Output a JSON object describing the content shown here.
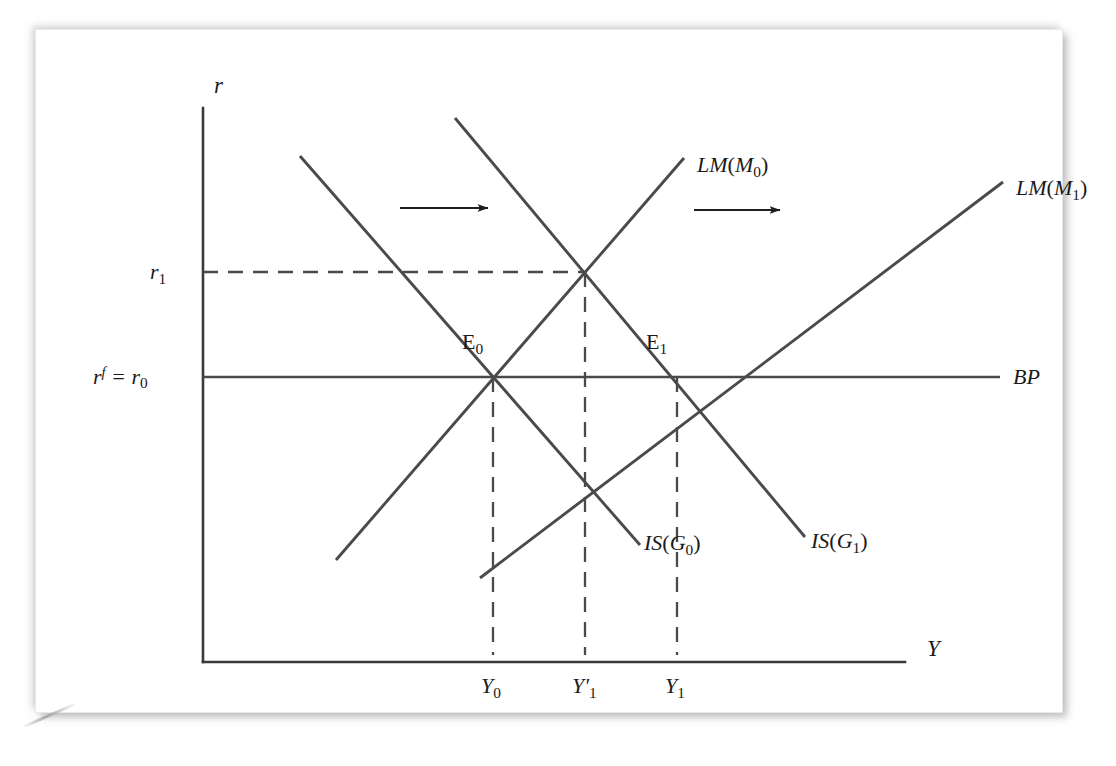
{
  "figure": {
    "kind": "economics-diagram",
    "model": "IS-LM-BP",
    "background_color": "#ffffff",
    "ink_color": "#3a3a3a"
  },
  "axes": {
    "y_axis_label": "r",
    "x_axis_label": "Y",
    "origin": {
      "x": 203,
      "y": 662
    },
    "y_top": {
      "x": 203,
      "y": 108
    },
    "x_right": {
      "x": 905,
      "y": 662
    }
  },
  "y_ticks": [
    {
      "id": "r1",
      "text": "r",
      "sub": "1",
      "value_y": 272,
      "label_x": 150,
      "label_y": 262
    },
    {
      "id": "rf_r0",
      "text": "r",
      "sup": "f",
      "eq": " = r",
      "sub": "0",
      "value_y": 377,
      "label_x": 93,
      "label_y": 366
    }
  ],
  "x_ticks": [
    {
      "id": "Y0",
      "text": "Y",
      "prime": "",
      "sub": "0",
      "value_x": 493,
      "label_x": 481,
      "label_y": 676
    },
    {
      "id": "Y1prime",
      "text": "Y",
      "prime": "′",
      "sub": "1",
      "value_x": 585,
      "label_x": 572,
      "label_y": 676
    },
    {
      "id": "Y1",
      "text": "Y",
      "prime": "",
      "sub": "1",
      "value_x": 677,
      "label_x": 665,
      "label_y": 676
    }
  ],
  "curves": [
    {
      "id": "is-g0",
      "label_main": "IS",
      "label_arg": "G",
      "label_sub": "0",
      "label_text": "IS(G0)",
      "label_x": 644,
      "label_y": 543,
      "x1": 300,
      "y1": 156,
      "x2": 640,
      "y2": 545,
      "slope": "downward"
    },
    {
      "id": "is-g1",
      "label_main": "IS",
      "label_arg": "G",
      "label_sub": "1",
      "label_text": "IS(G1)",
      "label_x": 811,
      "label_y": 541,
      "x1": 455,
      "y1": 118,
      "x2": 805,
      "y2": 537,
      "slope": "downward"
    },
    {
      "id": "lm-m0",
      "label_main": "LM",
      "label_arg": "M",
      "label_sub": "0",
      "label_text": "LM(M0)",
      "label_x": 697,
      "label_y": 165,
      "x1": 336,
      "y1": 560,
      "x2": 684,
      "y2": 158,
      "slope": "upward"
    },
    {
      "id": "lm-m1",
      "label_main": "LM",
      "label_arg": "M",
      "label_sub": "1",
      "label_text": "LM(M1)",
      "label_x": 1016,
      "label_y": 188,
      "x1": 480,
      "y1": 578,
      "x2": 1003,
      "y2": 182,
      "slope": "upward"
    },
    {
      "id": "bp",
      "label_main": "BP",
      "label_arg": "",
      "label_sub": "",
      "label_text": "BP",
      "label_x": 1013,
      "label_y": 367,
      "x1": 203,
      "y1": 377,
      "x2": 1000,
      "y2": 377,
      "slope": "horizontal"
    }
  ],
  "equilibria": [
    {
      "id": "E0",
      "text": "E",
      "sub": "0",
      "point_x": 493,
      "point_y": 377,
      "label_x": 462,
      "label_y": 332
    },
    {
      "id": "E1",
      "text": "E",
      "sub": "1",
      "point_x": 677,
      "point_y": 377,
      "label_x": 646,
      "label_y": 332
    }
  ],
  "intersections": [
    {
      "id": "temp-eq",
      "desc": "IS(G1) x LM(M0)",
      "point_x": 585,
      "point_y": 272
    }
  ],
  "dashed_guides": [
    {
      "id": "r1-horizontal",
      "x1": 203,
      "y1": 272,
      "x2": 585,
      "y2": 272
    },
    {
      "id": "Y0-vertical",
      "x1": 493,
      "y1": 377,
      "x2": 493,
      "y2": 655
    },
    {
      "id": "Y1prime-vertical",
      "x1": 585,
      "y1": 272,
      "x2": 585,
      "y2": 655
    },
    {
      "id": "Y1-vertical",
      "x1": 677,
      "y1": 377,
      "x2": 677,
      "y2": 655
    }
  ],
  "shift_arrows": [
    {
      "id": "is-shift-arrow",
      "x1": 400,
      "y1": 208,
      "x2": 492,
      "y2": 208,
      "direction": "right"
    },
    {
      "id": "lm-shift-arrow",
      "x1": 694,
      "y1": 210,
      "x2": 784,
      "y2": 210,
      "direction": "right"
    }
  ]
}
